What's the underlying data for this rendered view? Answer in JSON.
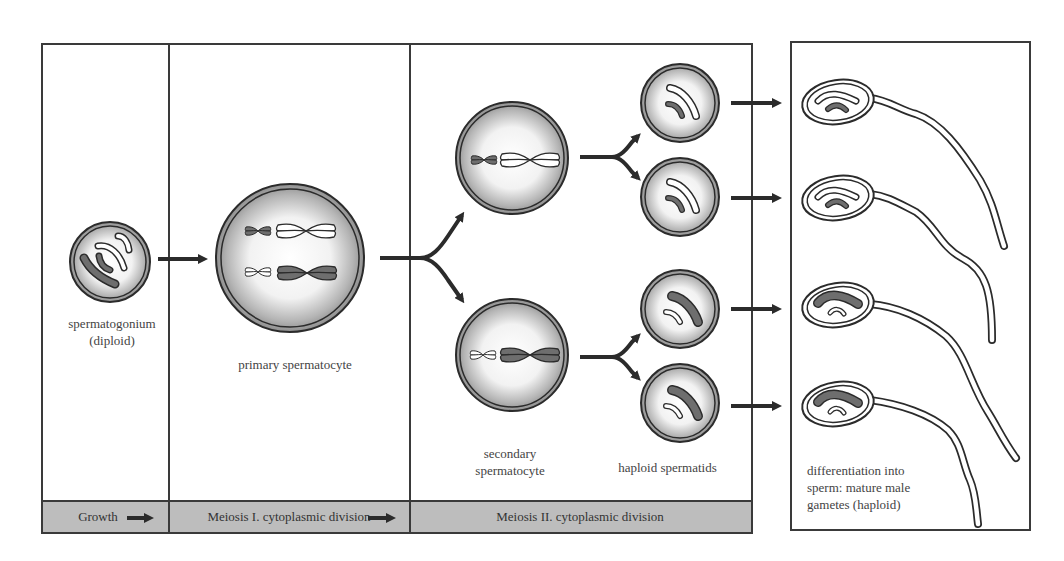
{
  "diagram": {
    "stages": [
      {
        "id": "spermatogonium",
        "label_line1": "spermatogonium",
        "label_line2": "(diploid)"
      },
      {
        "id": "primary",
        "label": "primary spermatocyte"
      },
      {
        "id": "secondary",
        "label_line1": "secondary",
        "label_line2": "spermatocyte"
      },
      {
        "id": "spermatids",
        "label": "haploid spermatids"
      },
      {
        "id": "sperm",
        "label_line1": "differentiation into",
        "label_line2": "sperm: mature male",
        "label_line3": "gametes (haploid)"
      }
    ],
    "phases": [
      {
        "label": "Growth"
      },
      {
        "label": "Meiosis I. cytoplasmic division"
      },
      {
        "label": "Meiosis II. cytoplasmic division"
      }
    ],
    "colors": {
      "line": "#2b2b2b",
      "band": "#bdbdbd",
      "cell_shade": "#9a9a9a",
      "chromosome_dark": "#6e6e6e",
      "chromosome_light": "#ffffff"
    }
  }
}
